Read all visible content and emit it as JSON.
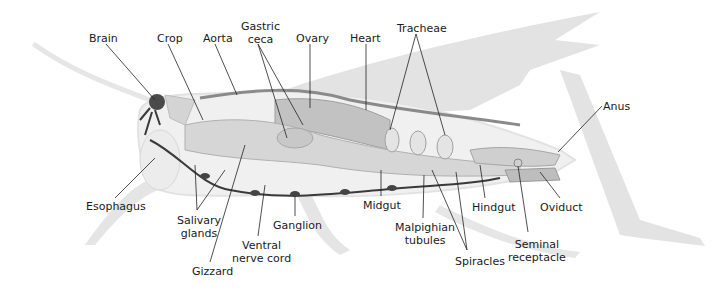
{
  "diagram": {
    "colors": {
      "background": "#ffffff",
      "silhouette": "#e3e3e3",
      "body_outline": "#efefef",
      "organ_light": "#d6d6d6",
      "organ_mid": "#b3b3b3",
      "organ_dark": "#6b6b6b",
      "nerve": "#3a3a3a",
      "leader_line": "#222222",
      "text": "#1a1a1a"
    },
    "labels": [
      {
        "id": "brain",
        "text": "Brain",
        "x": 89,
        "y": 32
      },
      {
        "id": "crop",
        "text": "Crop",
        "x": 157,
        "y": 32
      },
      {
        "id": "aorta",
        "text": "Aorta",
        "x": 203,
        "y": 32
      },
      {
        "id": "gastric-ceca",
        "text": "Gastric\nceca",
        "x": 241,
        "y": 20
      },
      {
        "id": "ovary",
        "text": "Ovary",
        "x": 296,
        "y": 32
      },
      {
        "id": "heart",
        "text": "Heart",
        "x": 350,
        "y": 32
      },
      {
        "id": "tracheae",
        "text": "Tracheae",
        "x": 397,
        "y": 22
      },
      {
        "id": "anus",
        "text": "Anus",
        "x": 603,
        "y": 100
      },
      {
        "id": "esophagus",
        "text": "Esophagus",
        "x": 86,
        "y": 200
      },
      {
        "id": "salivary-glands",
        "text": "Salivary\nglands",
        "x": 177,
        "y": 214
      },
      {
        "id": "gizzard",
        "text": "Gizzard",
        "x": 192,
        "y": 265
      },
      {
        "id": "ventral-nerve-cord",
        "text": "Ventral\nnerve cord",
        "x": 232,
        "y": 239
      },
      {
        "id": "ganglion",
        "text": "Ganglion",
        "x": 273,
        "y": 219
      },
      {
        "id": "midgut",
        "text": "Midgut",
        "x": 363,
        "y": 199
      },
      {
        "id": "malpighian-tubules",
        "text": "Malpighian\ntubules",
        "x": 395,
        "y": 221
      },
      {
        "id": "hindgut",
        "text": "Hindgut",
        "x": 472,
        "y": 201
      },
      {
        "id": "oviduct",
        "text": "Oviduct",
        "x": 540,
        "y": 201
      },
      {
        "id": "spiracles",
        "text": "Spiracles",
        "x": 455,
        "y": 255
      },
      {
        "id": "seminal-receptacle",
        "text": "Seminal\nreceptacle",
        "x": 508,
        "y": 238
      }
    ]
  }
}
